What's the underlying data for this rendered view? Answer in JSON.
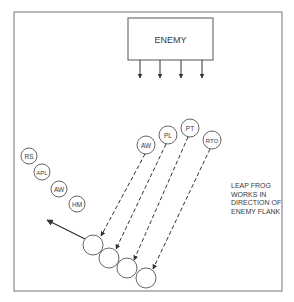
{
  "diagram": {
    "enemy_box": {
      "label": "ENEMY",
      "x": 128,
      "y": 18,
      "w": 85,
      "h": 42
    },
    "enemy_arrows_x": [
      140,
      160,
      181,
      202
    ],
    "left_group": [
      {
        "label": "RS",
        "cx": 29,
        "cy": 156
      },
      {
        "label": "APL",
        "cx": 42,
        "cy": 172
      },
      {
        "label": "AW",
        "cx": 59,
        "cy": 189
      },
      {
        "label": "HM",
        "cx": 77,
        "cy": 204
      }
    ],
    "top_group": [
      {
        "label": "AW",
        "cx": 146,
        "cy": 145
      },
      {
        "label": "PL",
        "cx": 168,
        "cy": 135
      },
      {
        "label": "PT",
        "cx": 190,
        "cy": 128
      },
      {
        "label": "RTO",
        "cx": 212,
        "cy": 140
      }
    ],
    "destination_positions": [
      {
        "cx": 93,
        "cy": 245
      },
      {
        "cx": 109,
        "cy": 258
      },
      {
        "cx": 127,
        "cy": 268
      },
      {
        "cx": 146,
        "cy": 278
      }
    ],
    "note": {
      "lines": [
        "LEAP FROG",
        "WORKS IN",
        "DIRECTION OF",
        "ENEMY FLANK"
      ]
    }
  }
}
